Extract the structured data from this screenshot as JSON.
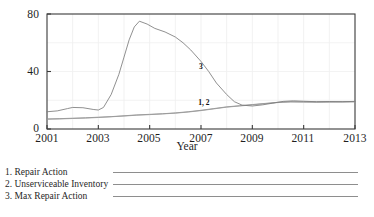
{
  "chart_data": {
    "type": "line",
    "title": "",
    "xlabel": "Year",
    "ylabel": "",
    "xlim": [
      2001,
      2013
    ],
    "ylim": [
      0,
      80
    ],
    "y_ticks": [
      0,
      40,
      80
    ],
    "x_ticks": [
      2001,
      2003,
      2005,
      2007,
      2009,
      2011,
      2013
    ],
    "grid": "faint vertical gridlines at each year, faint horizontal gridlines",
    "legend_position": "below-plot",
    "annotations": [
      {
        "text": "3",
        "x": 2007.0,
        "y": 44
      },
      {
        "text": "1, 2",
        "x": 2007.2,
        "y": 19
      }
    ],
    "series": [
      {
        "name": "Repair Action",
        "number": "1",
        "color": "#8e8e8e",
        "x": [
          2001.0,
          2001.5,
          2002.0,
          2002.5,
          2003.0,
          2003.5,
          2004.0,
          2004.5,
          2005.0,
          2005.5,
          2006.0,
          2006.5,
          2007.0,
          2007.5,
          2008.0,
          2008.5,
          2009.0,
          2009.5,
          2010.0,
          2010.5,
          2011.0,
          2011.5,
          2012.0,
          2012.5,
          2013.0
        ],
        "y": [
          7.0,
          7.2,
          7.5,
          7.8,
          8.2,
          8.6,
          9.2,
          9.8,
          10.2,
          10.6,
          11.2,
          12.0,
          13.0,
          14.2,
          15.4,
          16.2,
          17.0,
          17.8,
          18.6,
          19.0,
          18.9,
          18.8,
          18.9,
          18.9,
          19.0
        ]
      },
      {
        "name": "Unserviceable Inventory",
        "number": "2",
        "color": "#9a9a9a",
        "x": [
          2001.0,
          2001.5,
          2002.0,
          2002.5,
          2003.0,
          2003.5,
          2004.0,
          2004.5,
          2005.0,
          2005.5,
          2006.0,
          2006.5,
          2007.0,
          2007.5,
          2008.0,
          2008.5,
          2009.0,
          2009.5,
          2010.0,
          2010.5,
          2011.0,
          2011.5,
          2012.0,
          2012.5,
          2013.0
        ],
        "y": [
          6.8,
          7.0,
          7.3,
          7.6,
          8.0,
          8.5,
          9.0,
          9.6,
          10.0,
          10.5,
          11.0,
          11.8,
          12.8,
          14.0,
          15.2,
          16.0,
          16.8,
          17.6,
          18.4,
          18.8,
          18.7,
          18.6,
          18.7,
          18.8,
          18.9
        ]
      },
      {
        "name": "Max Repair Action",
        "number": "3",
        "color": "#7c7c7c",
        "x": [
          2001.0,
          2001.4,
          2001.8,
          2002.0,
          2002.4,
          2002.8,
          2003.0,
          2003.2,
          2003.5,
          2003.8,
          2004.0,
          2004.2,
          2004.4,
          2004.6,
          2004.9,
          2005.2,
          2005.6,
          2006.0,
          2006.3,
          2006.6,
          2007.0,
          2007.3,
          2007.6,
          2008.0,
          2008.3,
          2008.6,
          2009.0,
          2009.4,
          2009.8,
          2010.2,
          2010.6,
          2011.0,
          2011.5,
          2012.0,
          2012.5,
          2013.0
        ],
        "y": [
          12.0,
          12.6,
          14.2,
          15.0,
          14.8,
          13.6,
          13.2,
          15.0,
          24.0,
          38.0,
          50.0,
          62.0,
          71.0,
          75.0,
          73.0,
          70.0,
          67.5,
          64.0,
          60.0,
          55.0,
          47.0,
          40.0,
          32.0,
          24.0,
          19.0,
          16.6,
          16.0,
          16.8,
          18.0,
          19.2,
          19.6,
          19.3,
          19.0,
          19.1,
          19.0,
          19.2
        ]
      }
    ]
  },
  "axis": {
    "y_tick_labels": [
      "80",
      "40",
      "0"
    ],
    "x_tick_labels": [
      "2001",
      "2003",
      "2005",
      "2007",
      "2009",
      "2011",
      "2013"
    ],
    "x_title": "Year"
  },
  "annotations": {
    "series3_label": "3",
    "series12_label": "1, 2"
  },
  "legend": {
    "items": [
      {
        "label": "1. Repair Action"
      },
      {
        "label": "2. Unserviceable Inventory"
      },
      {
        "label": "3. Max Repair Action"
      }
    ]
  },
  "caption": {
    "partial_text": ""
  },
  "colors": {
    "series_line": "#8e8e8e",
    "axis": "#3a3a3a",
    "grid": "#ededed",
    "text": "#1f1f1f",
    "background": "#ffffff"
  }
}
